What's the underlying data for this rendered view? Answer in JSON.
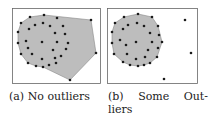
{
  "captions": {
    "a": "(a) No outliers",
    "b_line1_parts": [
      "(b)",
      "Some",
      "Out-"
    ],
    "b_line2": "liers"
  },
  "colors": {
    "hull_fill": "#bdbdbd",
    "hull_stroke": "#888888",
    "point": "#1a1a1a",
    "frame": "#666666"
  },
  "chart_data": [
    {
      "type": "scatter",
      "title": "(a) No outliers",
      "frame": [
        12,
        8,
        100,
        83
      ],
      "hull": [
        [
          44,
          15
        ],
        [
          91,
          20
        ],
        [
          96,
          53
        ],
        [
          70,
          80
        ],
        [
          43,
          67
        ],
        [
          36,
          66
        ],
        [
          28,
          63
        ],
        [
          21,
          54
        ],
        [
          18,
          43
        ],
        [
          18,
          32
        ],
        [
          21,
          23
        ],
        [
          30,
          17
        ]
      ],
      "points": [
        [
          30,
          17
        ],
        [
          44,
          15
        ],
        [
          57,
          18
        ],
        [
          91,
          20
        ],
        [
          21,
          23
        ],
        [
          35,
          25
        ],
        [
          43,
          23
        ],
        [
          50,
          26
        ],
        [
          63,
          26
        ],
        [
          29,
          29
        ],
        [
          18,
          32
        ],
        [
          55,
          33
        ],
        [
          65,
          34
        ],
        [
          26,
          41
        ],
        [
          18,
          43
        ],
        [
          42,
          42
        ],
        [
          57,
          42
        ],
        [
          68,
          43
        ],
        [
          28,
          48
        ],
        [
          66,
          49
        ],
        [
          53,
          50
        ],
        [
          96,
          53
        ],
        [
          21,
          54
        ],
        [
          32,
          54
        ],
        [
          61,
          56
        ],
        [
          42,
          59
        ],
        [
          55,
          58
        ],
        [
          28,
          63
        ],
        [
          36,
          66
        ],
        [
          49,
          65
        ],
        [
          43,
          67
        ],
        [
          56,
          63
        ],
        [
          70,
          80
        ]
      ]
    },
    {
      "type": "scatter",
      "title": "(b) Some Outliers",
      "frame": [
        107,
        8,
        197,
        83
      ],
      "hull": [
        [
          124,
          17
        ],
        [
          138,
          14
        ],
        [
          152,
          17
        ],
        [
          158,
          26
        ],
        [
          162,
          42
        ],
        [
          157,
          57
        ],
        [
          150,
          63
        ],
        [
          144,
          65
        ],
        [
          138,
          66
        ],
        [
          130,
          65
        ],
        [
          123,
          62
        ],
        [
          114,
          54
        ],
        [
          112,
          43
        ],
        [
          112,
          32
        ],
        [
          115,
          23
        ]
      ],
      "points": [
        [
          138,
          14
        ],
        [
          124,
          17
        ],
        [
          152,
          17
        ],
        [
          115,
          23
        ],
        [
          128,
          25
        ],
        [
          137,
          23
        ],
        [
          144,
          26
        ],
        [
          158,
          26
        ],
        [
          123,
          29
        ],
        [
          112,
          32
        ],
        [
          150,
          33
        ],
        [
          159,
          35
        ],
        [
          120,
          40
        ],
        [
          136,
          42
        ],
        [
          152,
          42
        ],
        [
          112,
          43
        ],
        [
          162,
          42
        ],
        [
          126,
          45
        ],
        [
          148,
          50
        ],
        [
          158,
          48
        ],
        [
          114,
          54
        ],
        [
          127,
          54
        ],
        [
          145,
          57
        ],
        [
          157,
          57
        ],
        [
          136,
          59
        ],
        [
          123,
          62
        ],
        [
          130,
          65
        ],
        [
          138,
          66
        ],
        [
          144,
          65
        ],
        [
          150,
          63
        ],
        [
          185,
          20
        ],
        [
          191,
          53
        ],
        [
          164,
          79
        ]
      ]
    }
  ]
}
